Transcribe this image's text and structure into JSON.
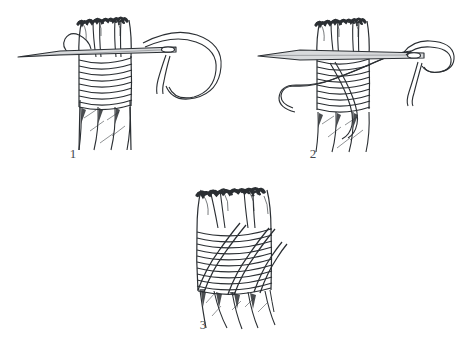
{
  "illustration": {
    "title": "Sailmaker's Whipping",
    "subject": "rope-end whipping sequence",
    "medium": "pen-and-ink line drawing",
    "background_color": "#ffffff",
    "ink_color": "#2b2f33",
    "label_color": "#44494e",
    "canvas": {
      "width": 468,
      "height": 349
    }
  },
  "figures": [
    {
      "id": "figure-1",
      "label": "1",
      "label_position": {
        "x": 63,
        "y": 147
      },
      "caption": "Needle passed through rope under the frayed strands with whipping turns laid and thread loop trailing right",
      "elements": {
        "rope": {
          "name": "rope",
          "center_x": 104,
          "top_y": 18,
          "bottom_y": 150,
          "width": 52,
          "strand_count": 3,
          "frayed_end": true
        },
        "whipping_turns": {
          "name": "whipping-turns",
          "count": 9,
          "top_y": 58,
          "bottom_y": 107
        },
        "needle": {
          "name": "needle",
          "tip_x": 18,
          "tip_y": 57,
          "eye_x": 172,
          "eye_y": 47,
          "orientation": "horizontal"
        },
        "thread_loop": {
          "name": "thread-loop",
          "extends_to_x": 228,
          "shape": "large trailing bight to the right"
        }
      }
    },
    {
      "id": "figure-2",
      "label": "2",
      "label_position": {
        "x": 303,
        "y": 147
      },
      "caption": "Thread carried diagonally up across the turns and passed back through the needle eye",
      "elements": {
        "rope": {
          "name": "rope",
          "center_x": 342,
          "top_y": 18,
          "bottom_y": 150,
          "width": 52,
          "strand_count": 3,
          "frayed_end": true
        },
        "whipping_turns": {
          "name": "whipping-turns",
          "count": 9,
          "top_y": 58,
          "bottom_y": 112
        },
        "needle": {
          "name": "needle",
          "tip_x": 258,
          "tip_y": 56,
          "eye_x": 418,
          "eye_y": 52,
          "orientation": "horizontal"
        },
        "diagonal_thread": {
          "name": "diagonal-thread",
          "direction": "lower-left to upper-right",
          "crosses_turns": true
        },
        "thread_loop": {
          "name": "thread-loop",
          "extends_to_x": 452,
          "shape": "open bight at the needle eye"
        }
      }
    },
    {
      "id": "figure-3",
      "label": "3",
      "label_position": {
        "x": 193,
        "y": 318
      },
      "caption": "Finished whipping with three diagonal cross turns drawn down over the horizontal turns",
      "elements": {
        "rope": {
          "name": "rope",
          "center_x": 234,
          "top_y": 188,
          "bottom_y": 318,
          "width": 76,
          "strand_count": 3,
          "frayed_end": true
        },
        "whipping_turns": {
          "name": "whipping-turns",
          "count": 11,
          "top_y": 228,
          "bottom_y": 288
        },
        "cross_turns": {
          "name": "cross-turns",
          "count": 3,
          "direction": "lower-left to upper-right"
        }
      }
    }
  ]
}
